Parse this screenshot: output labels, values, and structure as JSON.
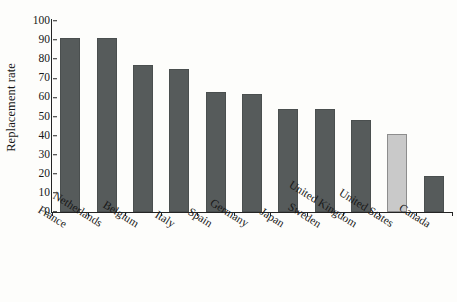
{
  "chart_data": {
    "type": "bar",
    "title": "",
    "xlabel": "",
    "ylabel": "Replacement rate",
    "ylim": [
      0,
      100
    ],
    "ytick_step": 10,
    "grid": false,
    "legend": null,
    "categories": [
      "France",
      "Netherlands",
      "Belgium",
      "Italy",
      "Spain",
      "Germany",
      "Japan",
      "Sweden",
      "United Kingdom",
      "United States",
      "Canada"
    ],
    "values": [
      91,
      91,
      77,
      75,
      63,
      62,
      54,
      54,
      48,
      41,
      19
    ],
    "yticks": [
      0,
      10,
      20,
      30,
      40,
      50,
      60,
      70,
      80,
      90,
      100
    ],
    "ytick_labels": [
      "0",
      "10",
      "20",
      "30",
      "40",
      "50",
      "60",
      "70",
      "80",
      "90",
      "100"
    ],
    "highlight_index": 9,
    "colors": {
      "bar": "#565b5b",
      "bar_border": "#4a4f4f",
      "highlight_bar": "#c9c9c9",
      "highlight_border": "#8d8d8d",
      "axis": "#242424",
      "text": "#171717",
      "background": "#fdfdfb"
    }
  }
}
